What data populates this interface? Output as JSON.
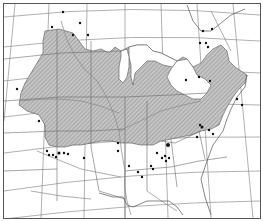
{
  "map": {
    "title": "",
    "type": "species distribution map",
    "region": "central and eastern United States",
    "colors": {
      "background": "#ffffff",
      "frame": "#555555",
      "range_fill": "#b8b8b8",
      "range_hatch": "#8a8a8a",
      "boundary": "#6a6a6a",
      "graticule": "#7a7a7a",
      "river": "#888888",
      "record_dot": "#111111"
    },
    "legend": {
      "shaded_area": "continuous range",
      "dots": "isolated records"
    },
    "record_dots": [
      [
        62,
        11
      ],
      [
        51,
        26
      ],
      [
        79,
        22
      ],
      [
        72,
        34
      ],
      [
        87,
        34
      ],
      [
        16,
        88
      ],
      [
        38,
        120
      ],
      [
        46,
        150
      ],
      [
        48,
        154
      ],
      [
        52,
        154
      ],
      [
        55,
        156
      ],
      [
        58,
        152
      ],
      [
        63,
        152
      ],
      [
        67,
        153
      ],
      [
        83,
        157
      ],
      [
        117,
        142
      ],
      [
        117,
        150
      ],
      [
        128,
        165
      ],
      [
        202,
        30
      ],
      [
        211,
        28
      ],
      [
        199,
        42
      ],
      [
        205,
        42
      ],
      [
        207,
        46
      ],
      [
        214,
        46
      ],
      [
        209,
        45
      ],
      [
        185,
        79
      ],
      [
        198,
        76
      ],
      [
        209,
        80
      ],
      [
        232,
        103
      ],
      [
        236,
        98
      ],
      [
        237,
        101
      ],
      [
        241,
        104
      ],
      [
        247,
        106
      ],
      [
        249,
        108
      ],
      [
        167,
        142
      ],
      [
        168,
        144
      ],
      [
        170,
        145
      ],
      [
        156,
        152
      ],
      [
        160,
        157
      ],
      [
        164,
        155
      ],
      [
        161,
        159
      ],
      [
        168,
        157
      ],
      [
        165,
        160
      ],
      [
        150,
        165
      ],
      [
        152,
        168
      ],
      [
        137,
        171
      ],
      [
        141,
        176
      ],
      [
        199,
        124
      ],
      [
        201,
        126
      ],
      [
        208,
        129
      ],
      [
        212,
        133
      ]
    ]
  }
}
